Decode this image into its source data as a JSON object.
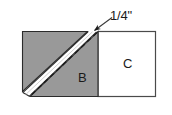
{
  "figure": {
    "labels": {
      "dimension": "1/4\"",
      "piece_b": "B",
      "piece_c": "C"
    },
    "colors": {
      "shaded_fabric": "#999999",
      "plain_fabric": "#ffffff",
      "outline": "#1a1a1a",
      "seam_strip": "#ffffff",
      "stitch_line": "#1a1a1a",
      "background": "#ffffff"
    },
    "geometry": {
      "outer_left": 22,
      "outer_top": 31,
      "outer_right": 156,
      "outer_bottom": 97,
      "square_divider_x": 98,
      "diagonal_from_x": 97,
      "diagonal_from_y": 31,
      "diagonal_to_x": 31,
      "diagonal_to_y": 95
    },
    "annotation": {
      "leader_start_x": 112,
      "leader_start_y": 18,
      "leader_end_x": 92,
      "leader_end_y": 33,
      "arrowhead": "filled-triangle",
      "points_to": "seam-allowance-edge"
    },
    "parts": [
      {
        "name": "folded-triangle",
        "fill": "shaded",
        "label": ""
      },
      {
        "name": "seam-allowance-strip",
        "fill": "plain",
        "label": ""
      },
      {
        "name": "triangle-b",
        "fill": "shaded",
        "label": "B"
      },
      {
        "name": "square-c",
        "fill": "plain",
        "label": "C"
      }
    ]
  }
}
